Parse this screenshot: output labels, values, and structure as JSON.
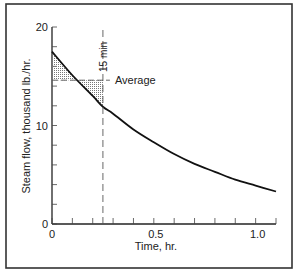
{
  "chart_data": {
    "type": "line",
    "title": "",
    "xlabel": "Time, hr.",
    "ylabel": "Steam flow, thousand lb./hr.",
    "xlim": [
      0,
      1.1
    ],
    "ylim": [
      0,
      20
    ],
    "x_tick_labels": [
      "0",
      "0.5",
      "1.0"
    ],
    "x_ticks": [
      0,
      0.1,
      0.2,
      0.3,
      0.4,
      0.5,
      0.6,
      0.7,
      0.8,
      0.9,
      1.0,
      1.1
    ],
    "y_tick_labels": [
      "0",
      "10",
      "20"
    ],
    "y_ticks": [
      0,
      2,
      4,
      6,
      8,
      10,
      12,
      14,
      16,
      18,
      20
    ],
    "grid": false,
    "series": [
      {
        "name": "Steam flow",
        "x": [
          0,
          0.1,
          0.2,
          0.25,
          0.3,
          0.4,
          0.5,
          0.6,
          0.7,
          0.8,
          0.9,
          1.0,
          1.1
        ],
        "y": [
          17.5,
          15.1,
          13.0,
          11.9,
          11.2,
          9.6,
          8.3,
          7.1,
          6.1,
          5.3,
          4.5,
          3.9,
          3.3
        ]
      }
    ],
    "annotations": [
      {
        "text": "15 min",
        "x": 0.25,
        "orientation": "vertical",
        "style": "dashed line"
      },
      {
        "text": "Average",
        "y": 14.6,
        "style": "dashed line from 0 to 0.25 hr"
      },
      {
        "text": "shaded area between curve and average line, 0–0.25 hr",
        "style": "hatched"
      }
    ]
  }
}
